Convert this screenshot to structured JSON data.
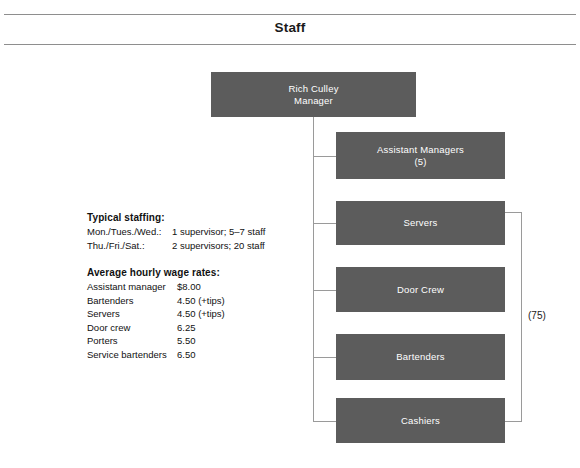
{
  "header": {
    "title": "Staff"
  },
  "org_chart": {
    "root": {
      "id": "manager",
      "name": "Rich Culley",
      "role": "Manager",
      "label": "Rich Culley\nManager"
    },
    "children": [
      {
        "id": "assistant-managers",
        "label": "Assistant Managers\n(5)",
        "title": "Assistant Managers",
        "count": "(5)"
      },
      {
        "id": "servers",
        "label": "Servers",
        "title": "Servers",
        "count": ""
      },
      {
        "id": "door-crew",
        "label": "Door Crew",
        "title": "Door Crew",
        "count": ""
      },
      {
        "id": "bartenders",
        "label": "Bartenders",
        "title": "Bartenders",
        "count": ""
      },
      {
        "id": "cashiers",
        "label": "Cashiers",
        "title": "Cashiers",
        "count": ""
      }
    ],
    "group_bracket": {
      "label": "(75)",
      "spans": [
        "servers",
        "door-crew",
        "bartenders",
        "cashiers"
      ]
    },
    "colors": {
      "box_fill": "#5c5c5c",
      "box_shadow": "#c9c9c9",
      "box_text": "#ffffff",
      "connector": "#9a9a9a"
    }
  },
  "notes": {
    "staffing": {
      "heading": "Typical staffing:",
      "rows": [
        {
          "label": "Mon./Tues./Wed.:",
          "value": "1 supervisor; 5–7 staff"
        },
        {
          "label": "Thu./Fri./Sat.:",
          "value": "2 supervisors; 20 staff"
        }
      ]
    },
    "wages": {
      "heading": "Average hourly wage rates:",
      "rows": [
        {
          "label": "Assistant manager",
          "value": "$8.00"
        },
        {
          "label": "Bartenders",
          "value": "4.50 (+tips)"
        },
        {
          "label": "Servers",
          "value": "4.50 (+tips)"
        },
        {
          "label": "Door crew",
          "value": "6.25"
        },
        {
          "label": "Porters",
          "value": "5.50"
        },
        {
          "label": "Service bartenders",
          "value": "6.50"
        }
      ]
    }
  }
}
